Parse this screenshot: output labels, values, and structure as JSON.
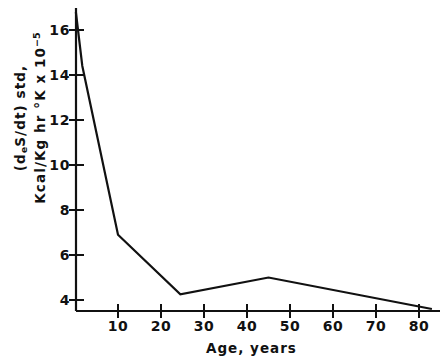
{
  "figure": {
    "background": "#ffffff",
    "ink": "#111111"
  },
  "chart_data": {
    "type": "line",
    "title": "",
    "subtitle": "",
    "xlabel": "Age, years",
    "ylabel_line1": "(d",
    "ylabel_line1_sub": "e",
    "ylabel_line1_rest": "S/dt) std,",
    "ylabel_line2_pre": "Kcal/Kg hr °K x 10",
    "ylabel_line2_sup": "−5",
    "ylabel_full": "(deS/dt) std, Kcal/Kg hr °K x 10^-5",
    "xlim": [
      0,
      84
    ],
    "ylim": [
      3.2,
      17.2
    ],
    "grid": false,
    "legend": null,
    "xticks": [
      10,
      20,
      30,
      40,
      50,
      60,
      70,
      80
    ],
    "xtick_labels": [
      "10",
      "20",
      "30",
      "40",
      "50",
      "60",
      "70",
      "80"
    ],
    "yticks": [
      4,
      6,
      8,
      10,
      12,
      14,
      16
    ],
    "ytick_labels": [
      "4",
      "6",
      "8",
      "10",
      "12",
      "14",
      "16"
    ],
    "series": [
      {
        "name": "entropy production rate",
        "color": "#111111",
        "linewidth": 2.2,
        "x": [
          0.2,
          1.7,
          10,
          24.5,
          45,
          83
        ],
        "values": [
          16.8,
          14.4,
          6.9,
          4.25,
          5.0,
          3.6
        ]
      }
    ],
    "annotations": []
  },
  "axes": {
    "x_axis_name": "age-axis",
    "y_axis_name": "entropy-rate-axis"
  }
}
